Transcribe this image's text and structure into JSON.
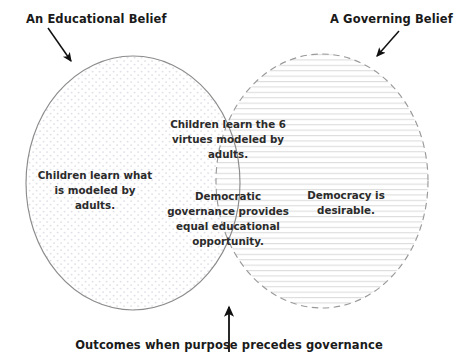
{
  "diagram": {
    "type": "venn",
    "title_caption": "Outcomes when purpose precedes governance",
    "labels": {
      "left": "An Educational Belief",
      "right": "A Governing Belief"
    },
    "sets": {
      "left": {
        "name": "An Educational Belief",
        "text": "Children learn what is modeled by adults.",
        "border_style": "solid",
        "border_color": "#8c8c8c",
        "fill_pattern": "dots",
        "fill_color": "#e3e3ea"
      },
      "right": {
        "name": "A Governing Belief",
        "text": "Democracy is desirable.",
        "border_style": "dashed",
        "border_color": "#9a9a9a",
        "fill_pattern": "horizontal-lines",
        "fill_color": "#dcdcdc"
      },
      "intersection": {
        "name": "Overlap",
        "text_top": "Children learn the 6 virtues modeled by adults.",
        "text_bottom": "Democratic governance provides equal educational opportunity."
      }
    },
    "annotations": [
      {
        "name": "arrow-to-left-circle",
        "from": [
          48,
          28
        ],
        "to": [
          73,
          64
        ]
      },
      {
        "name": "arrow-to-right-circle",
        "from": [
          399,
          31
        ],
        "to": [
          374,
          59
        ]
      },
      {
        "name": "arrow-to-intersection",
        "from": [
          229,
          352
        ],
        "to": [
          229,
          304
        ]
      }
    ],
    "colors": {
      "text": "#1a1a1a",
      "region_text": "#2b2b2b",
      "arrow": "#111111",
      "background": "#ffffff"
    }
  }
}
